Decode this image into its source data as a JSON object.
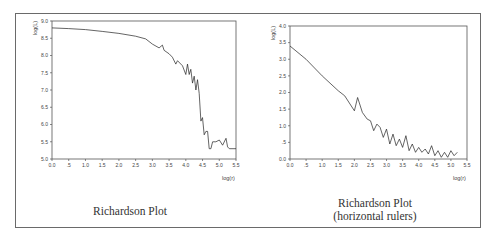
{
  "figure": {
    "panels": [
      {
        "caption": "Richardson Plot"
      },
      {
        "caption_line1": "Richardson Plot",
        "caption_line2": "(horizontal rulers)"
      }
    ]
  },
  "chart_data": [
    {
      "type": "line",
      "title": "Richardson Plot",
      "xlabel": "log(r)",
      "ylabel": "log(L)",
      "xlim": [
        0.0,
        5.5
      ],
      "ylim": [
        5.0,
        9.0
      ],
      "x_ticks": [
        "0.0",
        ".5",
        "1.0",
        "1.5",
        "2.0",
        "2.5",
        "3.0",
        "3.5",
        "4.0",
        "4.5",
        "5.0",
        "5.5"
      ],
      "y_ticks": [
        "5.0",
        "5.5",
        "6.0",
        "6.5",
        "7.0",
        "7.5",
        "8.0",
        "8.5",
        "9.0"
      ],
      "grid": false,
      "series": [
        {
          "name": "log(L)",
          "x": [
            0.0,
            0.5,
            1.0,
            1.5,
            2.0,
            2.5,
            2.8,
            3.0,
            3.2,
            3.3,
            3.35,
            3.5,
            3.6,
            3.7,
            3.75,
            3.9,
            4.0,
            4.05,
            4.1,
            4.15,
            4.2,
            4.25,
            4.3,
            4.35,
            4.4,
            4.45,
            4.5,
            4.55,
            4.6,
            4.65,
            4.7,
            4.75,
            4.8,
            4.9,
            5.0,
            5.1,
            5.2,
            5.25,
            5.3,
            5.5
          ],
          "y": [
            8.8,
            8.78,
            8.75,
            8.7,
            8.64,
            8.56,
            8.48,
            8.33,
            8.22,
            8.3,
            8.15,
            8.05,
            7.95,
            7.75,
            7.85,
            7.7,
            7.45,
            7.75,
            7.45,
            7.6,
            7.2,
            7.4,
            7.0,
            7.3,
            6.9,
            6.1,
            6.2,
            5.7,
            5.8,
            5.8,
            5.3,
            5.3,
            5.5,
            5.5,
            5.55,
            5.4,
            5.6,
            5.35,
            5.3,
            5.3
          ]
        }
      ]
    },
    {
      "type": "line",
      "title": "Richardson Plot (horizontal rulers)",
      "xlabel": "log(r)",
      "ylabel": "log(L)",
      "xlim": [
        0.0,
        5.5
      ],
      "ylim": [
        0.0,
        4.0
      ],
      "x_ticks": [
        "0.0",
        ".5",
        "1.0",
        "1.5",
        "2.0",
        "2.5",
        "3.0",
        "3.5",
        "4.0",
        "4.5",
        "5.0",
        "5.5"
      ],
      "y_ticks": [
        "0.0",
        ".5",
        "1.0",
        "1.5",
        "2.0",
        "2.5",
        "3.0",
        "3.5",
        "4.0"
      ],
      "grid": false,
      "series": [
        {
          "name": "log(L)",
          "x": [
            0.0,
            0.5,
            1.0,
            1.5,
            1.7,
            2.0,
            2.1,
            2.25,
            2.4,
            2.5,
            2.6,
            2.7,
            2.8,
            2.9,
            3.0,
            3.1,
            3.2,
            3.3,
            3.4,
            3.5,
            3.6,
            3.7,
            3.8,
            3.9,
            4.0,
            4.1,
            4.2,
            4.3,
            4.4,
            4.5,
            4.6,
            4.7,
            4.8,
            4.9,
            5.0,
            5.1,
            5.2
          ],
          "y": [
            3.4,
            3.0,
            2.5,
            2.05,
            1.9,
            1.45,
            1.85,
            1.4,
            1.2,
            1.15,
            0.85,
            1.05,
            0.95,
            0.65,
            0.9,
            0.45,
            0.75,
            0.4,
            0.6,
            0.35,
            0.7,
            0.25,
            0.45,
            0.2,
            0.35,
            0.2,
            0.3,
            0.15,
            0.4,
            0.1,
            0.25,
            0.05,
            0.2,
            0.05,
            0.25,
            0.1,
            0.2
          ]
        }
      ]
    }
  ]
}
